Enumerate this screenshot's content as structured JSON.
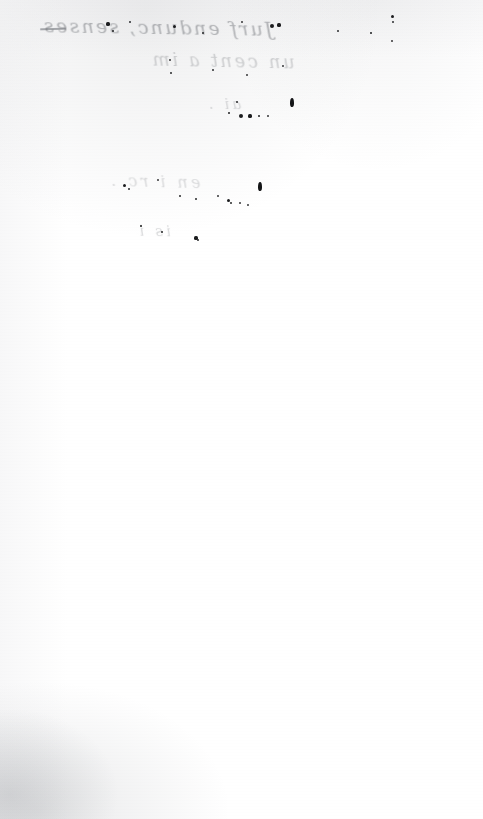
{
  "document": {
    "kind": "scanned-page",
    "title": "Scanned manuscript page (verso, blank side)",
    "page_width": 483,
    "page_height": 819,
    "paper_color": "#ffffff",
    "ink_color": "#1b1c1e",
    "bleed_ink_color": "#6f7277",
    "shadow_color": "#8c8f94",
    "orientation": "portrait",
    "content_note": "Blank reverse of a handwritten leaf; only mirrored ink bleed-through and scattered ink specks are visible."
  },
  "bleed_through": {
    "description": "Mirrored show-through of handwriting from the opposite side of the leaf",
    "mirrored": true,
    "lines": [
      {
        "id": "line-1",
        "text": "Jurf endunc, senses",
        "legible": false,
        "opacity": 0.5
      },
      {
        "id": "line-2",
        "text": "un cent a im",
        "legible": false,
        "opacity": 0.3
      },
      {
        "id": "line-3",
        "text": "ai  .",
        "legible": false,
        "opacity": 0.26
      },
      {
        "id": "line-4",
        "text": "en  i  rc  .",
        "legible": false,
        "opacity": 0.24
      },
      {
        "id": "line-5",
        "text": "is  i",
        "legible": false,
        "opacity": 0.26
      }
    ]
  },
  "ink_specks": {
    "description": "Discrete ink dots and blots transferred through the paper",
    "dots": [
      {
        "x": 108,
        "y": 24,
        "r": 1.6
      },
      {
        "x": 113,
        "y": 31,
        "r": 1.3
      },
      {
        "x": 130,
        "y": 22,
        "r": 1.1
      },
      {
        "x": 174,
        "y": 26,
        "r": 1.5
      },
      {
        "x": 203,
        "y": 33,
        "r": 1.2
      },
      {
        "x": 242,
        "y": 22,
        "r": 1.0
      },
      {
        "x": 272,
        "y": 26,
        "r": 2.0
      },
      {
        "x": 279,
        "y": 25,
        "r": 1.6
      },
      {
        "x": 338,
        "y": 31,
        "r": 1.1
      },
      {
        "x": 371,
        "y": 33,
        "r": 1.4
      },
      {
        "x": 392,
        "y": 16,
        "r": 1.5
      },
      {
        "x": 393,
        "y": 22,
        "r": 1.1
      },
      {
        "x": 392,
        "y": 41,
        "r": 1.0
      },
      {
        "x": 170,
        "y": 60,
        "r": 1.0
      },
      {
        "x": 171,
        "y": 73,
        "r": 1.2
      },
      {
        "x": 213,
        "y": 70,
        "r": 1.1
      },
      {
        "x": 247,
        "y": 75,
        "r": 1.0
      },
      {
        "x": 283,
        "y": 66,
        "r": 0.9
      },
      {
        "x": 237,
        "y": 102,
        "r": 1.2
      },
      {
        "x": 229,
        "y": 113,
        "r": 1.3
      },
      {
        "x": 241,
        "y": 116,
        "r": 2.1
      },
      {
        "x": 250,
        "y": 116,
        "r": 1.6
      },
      {
        "x": 259,
        "y": 116,
        "r": 1.3
      },
      {
        "x": 268,
        "y": 116,
        "r": 1.0
      },
      {
        "x": 124,
        "y": 185,
        "r": 1.5
      },
      {
        "x": 129,
        "y": 189,
        "r": 1.1
      },
      {
        "x": 158,
        "y": 180,
        "r": 1.0
      },
      {
        "x": 180,
        "y": 196,
        "r": 1.2
      },
      {
        "x": 196,
        "y": 199,
        "r": 1.2
      },
      {
        "x": 218,
        "y": 196,
        "r": 1.0
      },
      {
        "x": 228,
        "y": 200,
        "r": 1.5
      },
      {
        "x": 231,
        "y": 203,
        "r": 1.2
      },
      {
        "x": 240,
        "y": 203,
        "r": 1.0
      },
      {
        "x": 248,
        "y": 205,
        "r": 0.9
      },
      {
        "x": 141,
        "y": 226,
        "r": 1.4
      },
      {
        "x": 162,
        "y": 232,
        "r": 1.3
      },
      {
        "x": 196,
        "y": 238,
        "r": 1.6
      },
      {
        "x": 198,
        "y": 240,
        "r": 1.2
      }
    ],
    "blots": [
      {
        "x": 290,
        "y": 98,
        "w": 4,
        "h": 9
      },
      {
        "x": 258,
        "y": 182,
        "w": 4,
        "h": 9
      }
    ]
  },
  "scan_artifacts": {
    "top_band": "faint gray band along the top edge",
    "left_edge": "soft vertical gray gradient",
    "bottom_left_shadow": "gray mottled shadow in the lower-left corner"
  }
}
